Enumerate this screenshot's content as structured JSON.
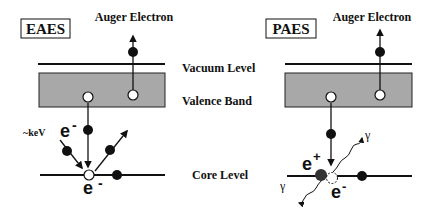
{
  "left_panel": {
    "title": "EAES",
    "auger_label": "Auger Electron",
    "incident_label": "~keV",
    "incident_particle": "e",
    "incident_charge": "-",
    "core_particle": "e",
    "core_charge": "-"
  },
  "right_panel": {
    "title": "PAES",
    "auger_label": "Auger Electron",
    "positron": "e",
    "positron_charge": "+",
    "electron": "e",
    "electron_charge": "-",
    "gamma1": "γ",
    "gamma2": "γ"
  },
  "levels": {
    "vacuum": "Vacuum Level",
    "valence": "Valence Band",
    "core": "Core Level"
  },
  "colors": {
    "band_fill": "#a8a8a8",
    "line": "#111111",
    "hole_fill": "#ffffff"
  }
}
